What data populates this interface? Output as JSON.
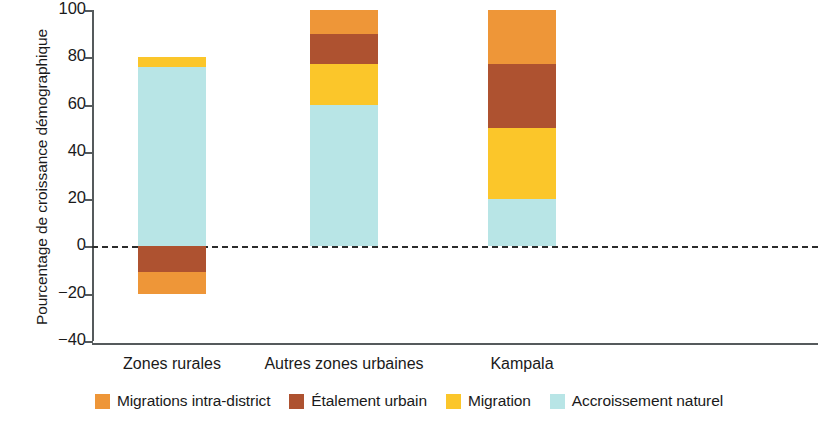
{
  "chart_data": {
    "type": "bar",
    "stacked": true,
    "title": "",
    "xlabel": "",
    "ylabel": "Pourcentage de croissance démographique",
    "ylim": [
      -40,
      100
    ],
    "yticks": [
      100,
      80,
      60,
      40,
      20,
      0,
      -20,
      -40
    ],
    "ytick_labels": [
      "100",
      "80",
      "60",
      "40",
      "20",
      "0",
      "−20",
      "−40"
    ],
    "grid": false,
    "zero_line": true,
    "legend_position": "bottom",
    "categories": [
      "Zones rurales",
      "Autres zones urbaines",
      "Kampala"
    ],
    "series": [
      {
        "name": "Migrations intra-district",
        "color": "#ee9638",
        "values": [
          -9,
          10,
          23
        ]
      },
      {
        "name": "Étalement urbain",
        "color": "#ae5230",
        "values": [
          -11,
          13,
          28
        ]
      },
      {
        "name": "Migration",
        "color": "#fbc62a",
        "values": [
          4,
          17,
          30
        ]
      },
      {
        "name": "Accroissement naturel",
        "color": "#b8e5e6",
        "values": [
          76,
          60,
          20
        ]
      }
    ],
    "bars": [
      {
        "category": "Zones rurales",
        "positive_segments": [
          {
            "series": "Accroissement naturel",
            "from": 0,
            "to": 76,
            "color": "#b8e5e6"
          },
          {
            "series": "Migration",
            "from": 76,
            "to": 80,
            "color": "#fbc62a"
          }
        ],
        "negative_segments": [
          {
            "series": "Étalement urbain",
            "from": 0,
            "to": -11,
            "color": "#ae5230"
          },
          {
            "series": "Migrations intra-district",
            "from": -11,
            "to": -20,
            "color": "#ee9638"
          }
        ]
      },
      {
        "category": "Autres zones urbaines",
        "positive_segments": [
          {
            "series": "Accroissement naturel",
            "from": 0,
            "to": 60,
            "color": "#b8e5e6"
          },
          {
            "series": "Migration",
            "from": 60,
            "to": 77,
            "color": "#fbc62a"
          },
          {
            "series": "Étalement urbain",
            "from": 77,
            "to": 90,
            "color": "#ae5230"
          },
          {
            "series": "Migrations intra-district",
            "from": 90,
            "to": 100,
            "color": "#ee9638"
          }
        ],
        "negative_segments": []
      },
      {
        "category": "Kampala",
        "positive_segments": [
          {
            "series": "Accroissement naturel",
            "from": 0,
            "to": 20,
            "color": "#b8e5e6"
          },
          {
            "series": "Migration",
            "from": 20,
            "to": 50,
            "color": "#fbc62a"
          },
          {
            "series": "Étalement urbain",
            "from": 50,
            "to": 77,
            "color": "#ae5230"
          },
          {
            "series": "Migrations intra-district",
            "from": 77,
            "to": 100,
            "color": "#ee9638"
          }
        ],
        "negative_segments": []
      }
    ]
  },
  "axis": {
    "y_title": "Pourcentage de croissance démographique"
  },
  "legend": {
    "items": [
      {
        "label": "Migrations intra-district",
        "color": "#ee9638"
      },
      {
        "label": "Étalement urbain",
        "color": "#ae5230"
      },
      {
        "label": "Migration",
        "color": "#fbc62a"
      },
      {
        "label": "Accroissement naturel",
        "color": "#b8e5e6"
      }
    ]
  }
}
